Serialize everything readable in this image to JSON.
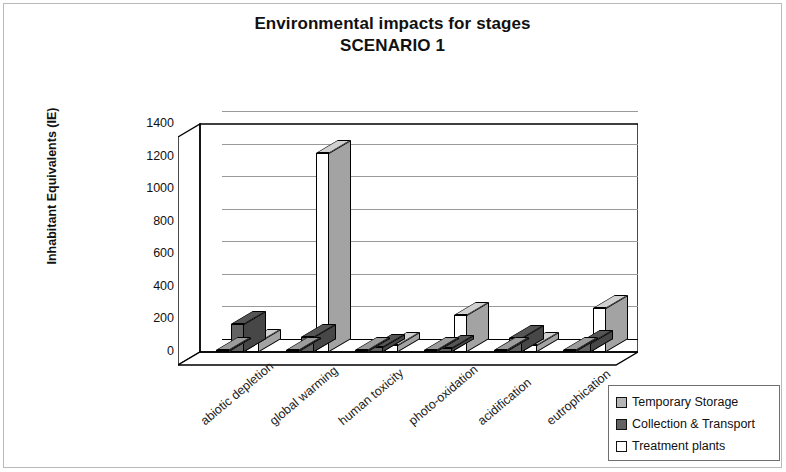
{
  "chart_data": {
    "type": "bar",
    "title": "Environmental impacts for stages",
    "subtitle": "SCENARIO 1",
    "xlabel": "",
    "ylabel": "Inhabitant Equivalents (IE)",
    "ylim": [
      0,
      1400
    ],
    "ytick_step": 200,
    "yticks": [
      "1400",
      "1200",
      "1000",
      "800",
      "600",
      "400",
      "200",
      "0"
    ],
    "grid": true,
    "legend_position": "bottom-right",
    "style": "3d-clustered-column",
    "categories": [
      "abiotic depletion",
      "global warming",
      "human toxicity",
      "photo-oxidation",
      "acidification",
      "eutrophication"
    ],
    "series": [
      {
        "name": "Temporary Storage",
        "color": "#b5b5b5",
        "values": [
          15,
          8,
          10,
          6,
          12,
          8
        ]
      },
      {
        "name": "Collection & Transport",
        "color": "#636363",
        "values": [
          170,
          90,
          30,
          25,
          85,
          55
        ]
      },
      {
        "name": "Treatment plants",
        "color": "#ffffff",
        "values": [
          60,
          1220,
          45,
          230,
          45,
          270
        ]
      }
    ]
  },
  "legend": {
    "items": [
      {
        "label": "Temporary Storage",
        "color": "#b5b5b5"
      },
      {
        "label": "Collection & Transport",
        "color": "#636363"
      },
      {
        "label": "Treatment plants",
        "color": "#ffffff"
      }
    ]
  }
}
